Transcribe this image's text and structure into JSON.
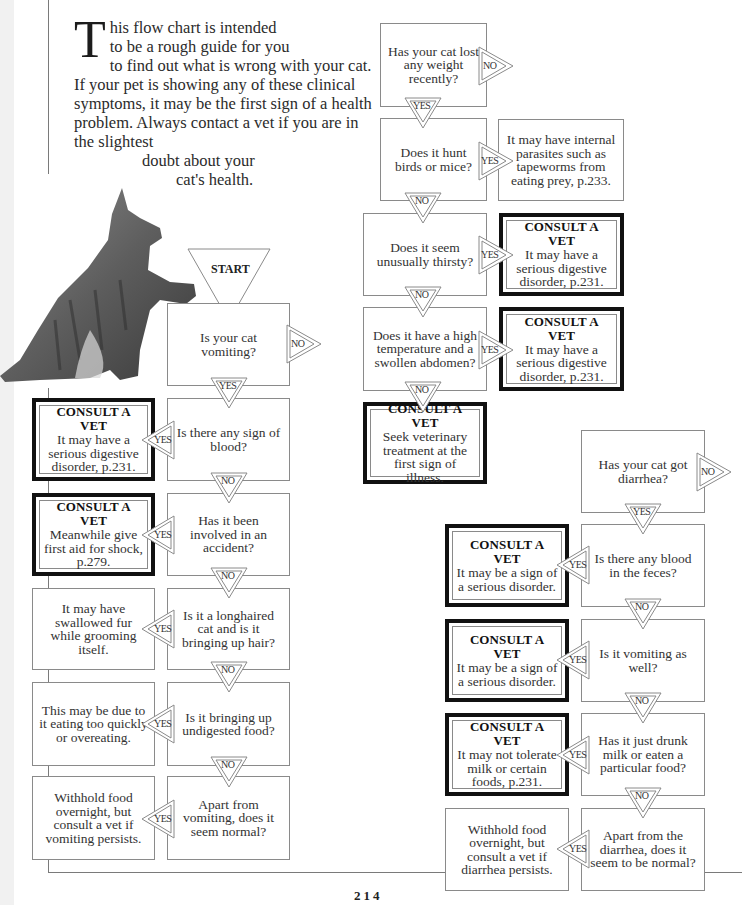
{
  "intro": {
    "dropcap": "T",
    "line1": "his flow chart is intended",
    "line2": "to be a rough guide for you",
    "body": "to find out what is wrong with your cat. If your pet is showing any of these clinical symptoms, it may be the first sign of a health problem. Always contact a vet if you are in the slightest",
    "tail1": "doubt about your",
    "tail2": "cat's health."
  },
  "labels": {
    "start": "START",
    "yes": "YES",
    "no": "NO",
    "consult": "CONSULT A VET"
  },
  "vomiting_flow": {
    "questions": [
      "Is your cat vomiting?",
      "Is there any sign of blood?",
      "Has it been involved in an accident?",
      "Is it a longhaired cat and is it bringing up hair?",
      "Is it bringing up undigested food?",
      "Apart from vomiting, does it seem normal?"
    ],
    "outcomes": [
      {
        "vet": true,
        "text": "It may have a serious digestive disorder, p.231."
      },
      {
        "vet": true,
        "text": "Meanwhile give first aid for shock, p.279."
      },
      {
        "vet": false,
        "text": "It may have swallowed fur while grooming itself."
      },
      {
        "vet": false,
        "text": "This may be due to it eating too quickly or overeating."
      },
      {
        "vet": false,
        "text": "Withhold food overnight, but consult a vet if vomiting persists."
      }
    ]
  },
  "weight_flow": {
    "questions": [
      "Has your cat lost any weight recently?",
      "Does it hunt birds or mice?",
      "Does it seem unusually thirsty?",
      "Does it have a high temperature and a swollen abdomen?"
    ],
    "outcomes": [
      {
        "vet": false,
        "text": "It may have internal parasites such as tapeworms from eating prey, p.233."
      },
      {
        "vet": true,
        "text": "It may have a serious digestive disorder, p.231."
      },
      {
        "vet": true,
        "text": "It may have a serious digestive disorder, p.231."
      },
      {
        "vet": true,
        "text": "Seek veterinary treatment at the first sign of illness."
      }
    ]
  },
  "diarrhea_flow": {
    "questions": [
      "Has your cat got diarrhea?",
      "Is there any blood in the feces?",
      "Is it vomiting as well?",
      "Has it just drunk milk or eaten a particular food?",
      "Apart from the diarrhea, does it seem to be normal?"
    ],
    "outcomes": [
      {
        "vet": true,
        "text": "It may be a sign of a serious disorder."
      },
      {
        "vet": true,
        "text": "It may be a sign of a serious disorder."
      },
      {
        "vet": true,
        "text": "It may not tolerate milk or certain foods, p.231."
      },
      {
        "vet": false,
        "text": "Withhold food overnight, but consult a vet if diarrhea persists."
      }
    ]
  },
  "page_number": "214"
}
